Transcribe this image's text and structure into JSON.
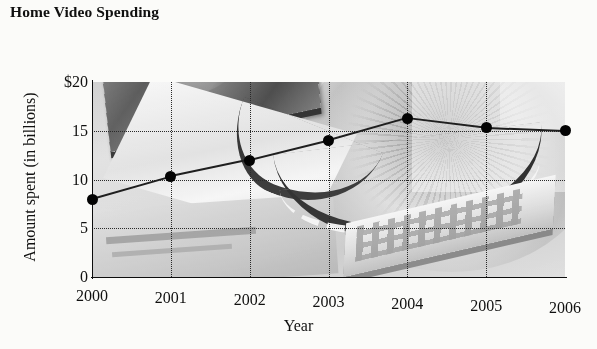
{
  "chart_data": {
    "type": "line",
    "title": "Home Video Spending",
    "xlabel": "Year",
    "ylabel": "Amount spent (in billions)",
    "categories": [
      "2000",
      "2001",
      "2002",
      "2003",
      "2004",
      "2005",
      "2006"
    ],
    "values": [
      8,
      10.3,
      12,
      14,
      16.3,
      15.3,
      15
    ],
    "xlim": [
      2000,
      2006
    ],
    "ylim": [
      0,
      20
    ],
    "yticks": [
      "0",
      "5",
      "10",
      "15",
      "$20"
    ],
    "ytick_values": [
      0,
      5,
      10,
      15,
      20
    ],
    "grid": true,
    "legend": "none",
    "series": [
      {
        "name": "Amount spent (in billions)",
        "values": [
          8,
          10.3,
          12,
          14,
          16.3,
          15.3,
          15
        ],
        "marker": "filled-circle",
        "color": "#080808"
      }
    ],
    "style": {
      "background": "photographic-collage",
      "palette": "grayscale",
      "line_color": "#23231f",
      "grid_color": "#2c2c2c",
      "axis_color": "#111111",
      "text_color": "#141414"
    },
    "background_elements": [
      "television-screen",
      "dvd-cases",
      "dvd-player-deck",
      "remote-control",
      "film-strip"
    ]
  }
}
